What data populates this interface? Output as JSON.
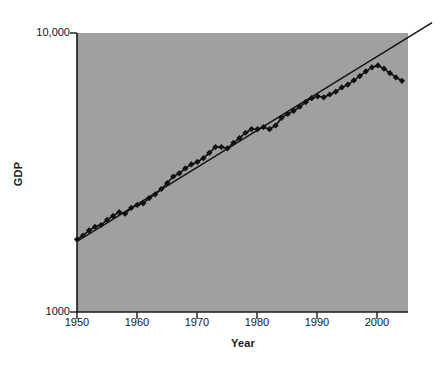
{
  "chart_data": {
    "type": "scatter",
    "title": "",
    "xlabel": "Year",
    "ylabel": "GDP",
    "xlim": [
      1950,
      2005
    ],
    "ylim": [
      1000,
      10000
    ],
    "yscale": "log",
    "grid": false,
    "legend": null,
    "background": "#a0a0a0",
    "marker": "diamond",
    "marker_color": "#101010",
    "line_color": "#101010",
    "xticks": [
      1950,
      1960,
      1970,
      1980,
      1990,
      2000
    ],
    "xtick_labels": [
      "1950",
      "1960",
      "1970",
      "1980",
      "1990",
      "2000"
    ],
    "yticks": [
      1000,
      10000
    ],
    "ytick_labels": [
      "1000",
      "10,000"
    ],
    "series": [
      {
        "name": "GDP",
        "x": [
          1950,
          1951,
          1952,
          1953,
          1954,
          1955,
          1956,
          1957,
          1958,
          1959,
          1960,
          1961,
          1962,
          1963,
          1964,
          1965,
          1966,
          1967,
          1968,
          1969,
          1970,
          1971,
          1972,
          1973,
          1974,
          1975,
          1976,
          1977,
          1978,
          1979,
          1980,
          1981,
          1982,
          1983,
          1984,
          1985,
          1986,
          1987,
          1988,
          1989,
          1990,
          1991,
          1992,
          1993,
          1994,
          1995,
          1996,
          1997,
          1998,
          1999,
          2000,
          2001,
          2002,
          2003,
          2004
        ],
        "y": [
          1820,
          1880,
          1960,
          2020,
          2050,
          2140,
          2210,
          2280,
          2250,
          2360,
          2420,
          2450,
          2560,
          2640,
          2760,
          2900,
          3060,
          3140,
          3270,
          3380,
          3450,
          3560,
          3720,
          3900,
          3900,
          3860,
          4040,
          4200,
          4390,
          4520,
          4520,
          4600,
          4520,
          4660,
          4960,
          5130,
          5260,
          5440,
          5650,
          5840,
          5930,
          5880,
          6020,
          6160,
          6380,
          6530,
          6760,
          7010,
          7290,
          7530,
          7650,
          7450,
          7180,
          6930,
          6740
        ]
      }
    ],
    "trend_line": {
      "name": "fitted exponential trend",
      "x": [
        1950,
        2009
      ],
      "y": [
        1790,
        10900
      ],
      "extends_beyond_axes": true
    }
  },
  "axes": {
    "y_title": "GDP",
    "x_title": "Year"
  }
}
